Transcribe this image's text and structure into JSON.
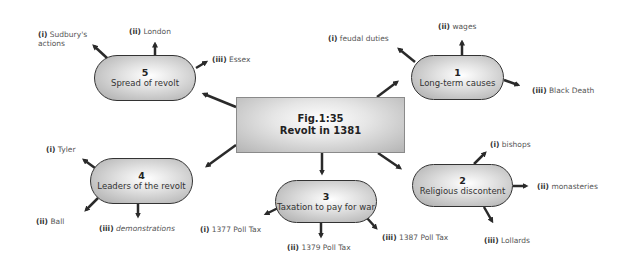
{
  "center": {
    "line1": "Fig.1:35",
    "line2": "Revolt in 1381"
  },
  "nodes": [
    {
      "number": "1",
      "title": "Long-term causes",
      "branches": [
        {
          "roman": "(i)",
          "text": "feudal duties"
        },
        {
          "roman": "(ii)",
          "text": "wages"
        },
        {
          "roman": "(iii)",
          "text": "Black Death"
        }
      ]
    },
    {
      "number": "2",
      "title": "Religious discontent",
      "branches": [
        {
          "roman": "(i)",
          "text": "bishops"
        },
        {
          "roman": "(ii)",
          "text": "monasteries"
        },
        {
          "roman": "(iii)",
          "text": "Lollards"
        }
      ]
    },
    {
      "number": "3",
      "title": "Taxation to pay for war",
      "branches": [
        {
          "roman": "(i)",
          "text": "1377 Poll Tax"
        },
        {
          "roman": "(ii)",
          "text": "1379 Poll Tax"
        },
        {
          "roman": "(iii)",
          "text": "1387 Poll Tax"
        }
      ]
    },
    {
      "number": "4",
      "title": "Leaders of the revolt",
      "branches": [
        {
          "roman": "(i)",
          "text": "Tyler"
        },
        {
          "roman": "(ii)",
          "text": "Ball"
        },
        {
          "roman": "(iii)",
          "text": "demonstrations"
        }
      ]
    },
    {
      "number": "5",
      "title": "Spread of revolt",
      "branches": [
        {
          "roman": "(i)",
          "text": "Sudbury's"
        },
        {
          "roman": "(ii)",
          "text": "London"
        },
        {
          "roman": "(iii)",
          "text": "Essex"
        }
      ],
      "branch_i_line2": "actions"
    }
  ],
  "colors": {
    "arrow": "#2a2a2a",
    "node_border": "#333333",
    "label_text": "#555555"
  }
}
